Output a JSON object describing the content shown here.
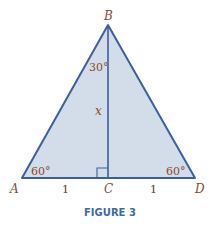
{
  "figure": {
    "caption": "FIGURE 3",
    "vertices": {
      "A": "A",
      "B": "B",
      "C": "C",
      "D": "D"
    },
    "angles": {
      "B_half": "30°",
      "A": "60°",
      "D": "60°"
    },
    "segments": {
      "BC": "x",
      "AC": "1",
      "CD": "1"
    },
    "colors": {
      "line": "#3d5f9e",
      "fill": "#d3dde9",
      "label": "#8a4a2a",
      "caption": "#3a6aa8"
    }
  }
}
